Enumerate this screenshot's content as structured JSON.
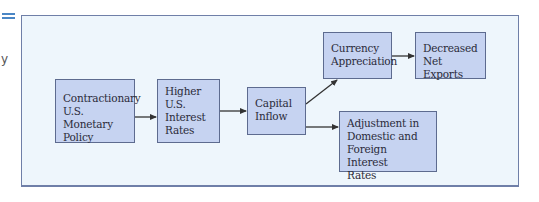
{
  "page": {
    "left_margin_text": "y"
  },
  "diagram": {
    "colors": {
      "frame_background": "#eef6fc",
      "frame_border": "#6f7fa8",
      "node_fill": "#c6d3f1",
      "node_border": "#5d6b8f",
      "arrow": "#333333",
      "side_rule": "#4a86c5"
    },
    "nodes": [
      {
        "id": "contractionary-policy",
        "label": "Contractionary\nU.S. Monetary\nPolicy"
      },
      {
        "id": "higher-rates",
        "label": "Higher\nU.S.\nInterest\nRates"
      },
      {
        "id": "capital-inflow",
        "label": "Capital\nInflow"
      },
      {
        "id": "currency-appreciation",
        "label": "Currency\nAppreciation"
      },
      {
        "id": "decreased-net-exports",
        "label": "Decreased\nNet Exports"
      },
      {
        "id": "rate-adjustment",
        "label": "Adjustment in\nDomestic and\nForeign Interest\nRates"
      }
    ],
    "edges": [
      {
        "from": "contractionary-policy",
        "to": "higher-rates"
      },
      {
        "from": "higher-rates",
        "to": "capital-inflow"
      },
      {
        "from": "capital-inflow",
        "to": "currency-appreciation"
      },
      {
        "from": "currency-appreciation",
        "to": "decreased-net-exports"
      },
      {
        "from": "capital-inflow",
        "to": "rate-adjustment"
      }
    ]
  }
}
